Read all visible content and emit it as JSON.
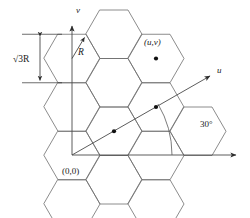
{
  "figure": {
    "axes": {
      "vertical_label": "v",
      "horizontal_label": "",
      "u_label": "u"
    },
    "labels": {
      "origin": "(0,0)",
      "cell_coord": "(u,v)",
      "radius": "R",
      "spacing_prefix": "√",
      "spacing_index": "3",
      "spacing_suffix": "R",
      "spacing_full": "√3R",
      "angle": "30°"
    },
    "colors": {
      "hex_stroke": "#6e6e6e",
      "axis_stroke": "#4a4a4a",
      "dot_fill": "#111111",
      "text": "#1a1a1a",
      "background": "#ffffff"
    },
    "geometry": {
      "hex_radius": 28,
      "origin_x": 72,
      "origin_y": 155,
      "u_axis_angle_deg": 30
    }
  }
}
